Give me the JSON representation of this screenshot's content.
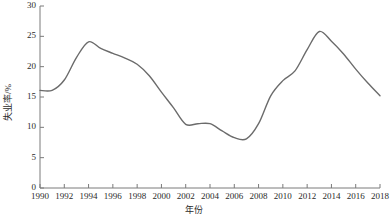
{
  "chart_data": {
    "type": "line",
    "title": "",
    "xlabel": "年份",
    "ylabel": "失业率/%",
    "xlim": [
      1990,
      2018
    ],
    "ylim": [
      0,
      30
    ],
    "xticks": [
      1990,
      1992,
      1994,
      1996,
      1998,
      2000,
      2002,
      2004,
      2006,
      2008,
      2010,
      2012,
      2014,
      2016,
      2018
    ],
    "yticks": [
      0,
      5,
      10,
      15,
      20,
      25,
      30
    ],
    "xtick_labels": [
      "1990",
      "1992",
      "1994",
      "1996",
      "1998",
      "2000",
      "2002",
      "2004",
      "2006",
      "2008",
      "2010",
      "2012",
      "2014",
      "2016",
      "2018"
    ],
    "ytick_labels": [
      "0",
      "5",
      "10",
      "15",
      "20",
      "25",
      "30"
    ],
    "grid": false,
    "legend": false,
    "line_color": "#6b6b6b",
    "axis_color": "#7a7a7a",
    "x": [
      1990,
      1991,
      1992,
      1993,
      1994,
      1995,
      1996,
      1997,
      1998,
      1999,
      2000,
      2001,
      2002,
      2003,
      2004,
      2005,
      2006,
      2007,
      2008,
      2009,
      2010,
      2011,
      2012,
      2013,
      2014,
      2015,
      2016,
      2017,
      2018
    ],
    "values": [
      16.1,
      16.1,
      17.8,
      21.5,
      24.1,
      23.0,
      22.2,
      21.4,
      20.4,
      18.5,
      15.8,
      13.2,
      10.5,
      10.6,
      10.6,
      9.4,
      8.3,
      8.1,
      10.6,
      15.2,
      17.7,
      19.3,
      22.8,
      25.8,
      24.2,
      22.1,
      19.6,
      17.3,
      15.2
    ]
  }
}
